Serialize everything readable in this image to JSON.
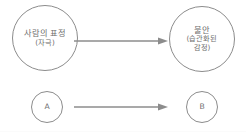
{
  "diagram": {
    "type": "flow",
    "title": "",
    "background_color": "#ffffff",
    "stroke_color": "#8c8c8c",
    "text_color": "#6e6e6e",
    "nodes": [
      {
        "id": "stimulus",
        "shape": "circle",
        "size": "large",
        "line_main": "사람의 표정",
        "line_sub": "(자극)"
      },
      {
        "id": "anxiety",
        "shape": "circle",
        "size": "large",
        "line_main": "불안",
        "line_sub": "(습관화된",
        "line_sub2": "감정)"
      },
      {
        "id": "a",
        "shape": "circle",
        "size": "small",
        "label": "A"
      },
      {
        "id": "b",
        "shape": "circle",
        "size": "small",
        "label": "B"
      }
    ],
    "edges": [
      {
        "id": "top",
        "from": "stimulus",
        "to": "anxiety",
        "style": "solid-arrow"
      },
      {
        "id": "bottom",
        "from": "a",
        "to": "b",
        "style": "solid-arrow"
      }
    ]
  }
}
